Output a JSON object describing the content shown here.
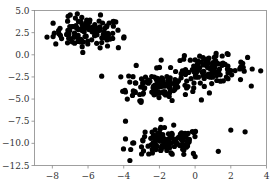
{
  "chart_data": {
    "type": "scatter",
    "title": "",
    "xlabel": "",
    "ylabel": "",
    "xlim": [
      -9.0,
      4.0
    ],
    "ylim": [
      -12.5,
      5.0
    ],
    "grid": false,
    "legend": null,
    "xticks": [
      -8,
      -6,
      -4,
      -2,
      0,
      2,
      4
    ],
    "xtick_labels": [
      "−8",
      "−6",
      "−4",
      "−2",
      "0",
      "2",
      "4"
    ],
    "yticks": [
      5.0,
      2.5,
      0.0,
      -2.5,
      -5.0,
      -7.5,
      -10.0,
      -12.5
    ],
    "ytick_labels": [
      "5.0",
      "2.5",
      "0.0",
      "−2.5",
      "−5.0",
      "−7.5",
      "−10.0",
      "−12.5"
    ],
    "marker_color": "#000000",
    "marker_size": 2.6,
    "clusters": [
      {
        "name": "upper-left",
        "center": [
          -6.0,
          2.5
        ],
        "std": [
          0.95,
          0.85
        ],
        "n": 110
      },
      {
        "name": "middle",
        "center": [
          -2.1,
          -3.4
        ],
        "std": [
          0.9,
          0.85
        ],
        "n": 110
      },
      {
        "name": "right",
        "center": [
          0.9,
          -1.6
        ],
        "std": [
          1.0,
          0.75
        ],
        "n": 110
      },
      {
        "name": "bottom",
        "center": [
          -1.5,
          -9.9
        ],
        "std": [
          0.95,
          0.8
        ],
        "n": 120
      }
    ],
    "outliers": [
      [
        -8.3,
        2.0
      ],
      [
        -7.0,
        4.5
      ],
      [
        -5.3,
        4.5
      ],
      [
        -4.0,
        1.9
      ],
      [
        -4.3,
        0.8
      ],
      [
        -3.3,
        -1.2
      ],
      [
        -3.8,
        -5.0
      ],
      [
        -3.9,
        -4.2
      ],
      [
        -3.1,
        -5.2
      ],
      [
        -3.9,
        -7.5
      ],
      [
        -3.9,
        -9.5
      ],
      [
        2.0,
        -8.5
      ],
      [
        2.8,
        -8.7
      ],
      [
        1.3,
        -10.9
      ],
      [
        -3.0,
        -11.2
      ],
      [
        -2.6,
        -11.2
      ],
      [
        0.0,
        -11.5
      ],
      [
        3.2,
        -1.6
      ],
      [
        -1.9,
        -0.6
      ],
      [
        -0.6,
        -0.1
      ],
      [
        0.8,
        -4.3
      ]
    ]
  }
}
